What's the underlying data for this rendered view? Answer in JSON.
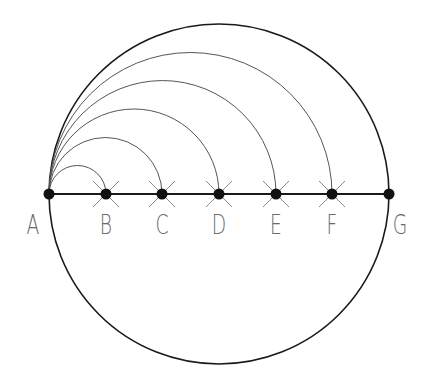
{
  "diagram": {
    "title": "",
    "colors": {
      "outline": "#1a1a1a",
      "arc": "#555555",
      "cross": "#8a8a8a",
      "point": "#111111",
      "label": "#6a6a6a"
    },
    "circle": {
      "cx": 219,
      "cy": 194,
      "r": 170
    },
    "baseline": {
      "from": "A",
      "to": "G",
      "y": 194
    },
    "points": [
      {
        "id": "A",
        "label": "A",
        "x": 49
      },
      {
        "id": "B",
        "label": "B",
        "x": 106
      },
      {
        "id": "C",
        "label": "C",
        "x": 162
      },
      {
        "id": "D",
        "label": "D",
        "x": 219
      },
      {
        "id": "E",
        "label": "E",
        "x": 276
      },
      {
        "id": "F",
        "label": "F",
        "x": 332
      },
      {
        "id": "G",
        "label": "G",
        "x": 389
      }
    ],
    "arcs_from_A_to": [
      "B",
      "C",
      "D",
      "E",
      "F"
    ],
    "crossed_points": [
      "B",
      "C",
      "D",
      "E",
      "F"
    ]
  }
}
